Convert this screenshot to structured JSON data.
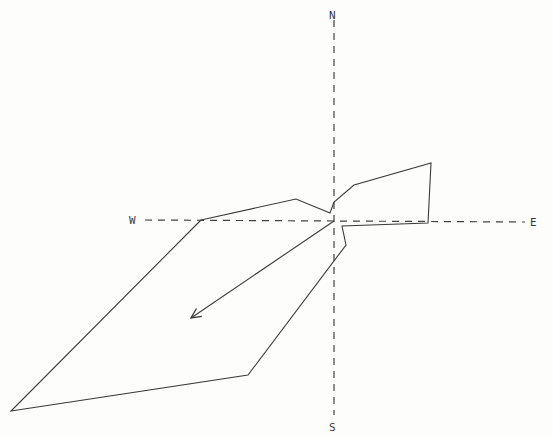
{
  "diagram": {
    "type": "wind-rose-polar-plot",
    "compass": {
      "north": "N",
      "south": "S",
      "east": "E",
      "west": "W"
    },
    "center": [
      334,
      221
    ],
    "axes": {
      "horizontal": {
        "from": [
          145,
          220
        ],
        "to": [
          525,
          222
        ]
      },
      "vertical": {
        "from": [
          334,
          20
        ],
        "to": [
          334,
          415
        ]
      }
    },
    "polygon_points": [
      [
        201,
        220
      ],
      [
        296,
        199
      ],
      [
        330,
        213
      ],
      [
        334,
        202
      ],
      [
        354,
        185
      ],
      [
        431,
        163
      ],
      [
        428,
        223
      ],
      [
        342,
        226
      ],
      [
        346,
        245
      ],
      [
        248,
        375
      ],
      [
        11,
        411
      ],
      [
        201,
        220
      ]
    ],
    "resultant_arrow": {
      "from": [
        334,
        221
      ],
      "to": [
        191,
        318
      ]
    },
    "colors": {
      "line": "#3a3a3a",
      "axis": "#444444",
      "background": "#fdfdfb"
    }
  }
}
